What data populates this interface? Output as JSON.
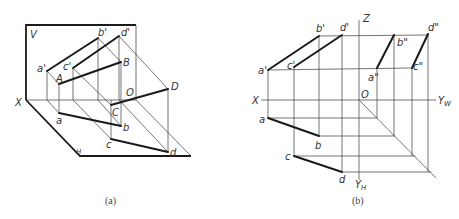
{
  "figure_a": {
    "caption": "(a)",
    "plane_v_label": "V",
    "plane_h_label": "H",
    "axis_x_label": "X",
    "origin_label": "O",
    "points": {
      "a_prime": "a'",
      "b_prime": "b'",
      "c_prime": "c'",
      "d_prime": "d'",
      "A": "A",
      "B": "B",
      "C": "C",
      "D": "D",
      "a": "a",
      "b": "b",
      "c": "c",
      "d": "d"
    }
  },
  "figure_b": {
    "caption": "(b)",
    "axis_x_label": "X",
    "axis_z_label": "Z",
    "axis_yw_label": "Y",
    "axis_yw_sub": "W",
    "axis_yh_label": "Y",
    "axis_yh_sub": "H",
    "origin_label": "O",
    "points": {
      "a_prime": "a'",
      "b_prime": "b'",
      "c_prime": "c'",
      "d_prime": "d'",
      "a_dprime": "a\"",
      "b_dprime": "b\"",
      "c_dprime": "c\"",
      "d_dprime": "d\"",
      "a": "a",
      "b": "b",
      "c": "c",
      "d": "d"
    }
  }
}
